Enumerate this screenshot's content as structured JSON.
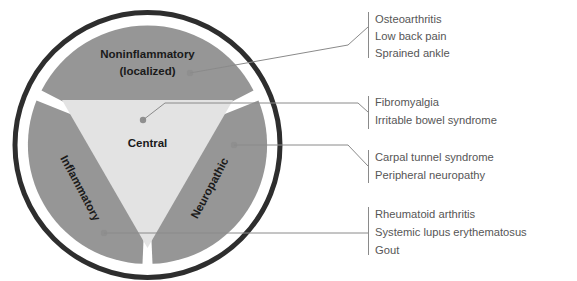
{
  "diagram": {
    "colors": {
      "outer_ring": "#2e2e2e",
      "ring_gap": "#ffffff",
      "wedge": "#969696",
      "center_triangle": "#e3e3e3",
      "leader_line": "#8a8a8a",
      "callout_text": "#565656",
      "wedge_text": "#1a1a1a",
      "dot": "#8f8f8f",
      "background": "#ffffff"
    },
    "center": {
      "label": "Central"
    },
    "wedges": [
      {
        "id": "noninflammatory",
        "label_line1": "Noninflammatory",
        "label_line2": "(localized)"
      },
      {
        "id": "inflammatory",
        "label_line1": "Inflammatory",
        "label_line2": ""
      },
      {
        "id": "neuropathic",
        "label_line1": "Neuropathic",
        "label_line2": ""
      }
    ],
    "callouts": [
      {
        "id": "noninflammatory-examples",
        "source": "noninflammatory",
        "items": [
          "Osteoarthritis",
          "Low back pain",
          "Sprained ankle"
        ]
      },
      {
        "id": "central-examples",
        "source": "central",
        "items": [
          "Fibromyalgia",
          "Irritable bowel syndrome"
        ]
      },
      {
        "id": "neuropathic-examples",
        "source": "neuropathic",
        "items": [
          "Carpal tunnel syndrome",
          "Peripheral neuropathy"
        ]
      },
      {
        "id": "inflammatory-examples",
        "source": "inflammatory",
        "items": [
          "Rheumatoid arthritis",
          "Systemic lupus erythematosus",
          "Gout"
        ]
      }
    ]
  }
}
